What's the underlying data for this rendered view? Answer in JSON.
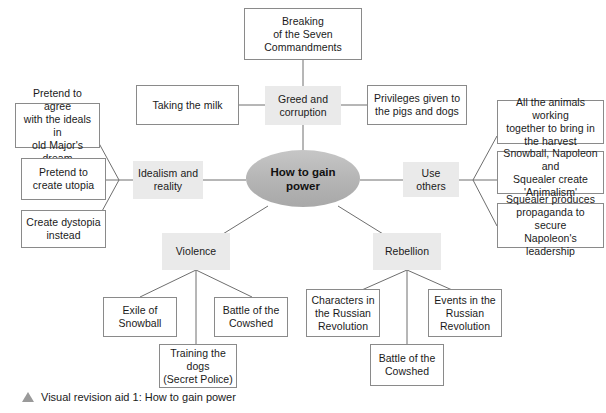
{
  "diagram": {
    "type": "mind-map",
    "center": {
      "label": "How to gain\npower",
      "shape": "ellipse",
      "fill": "#b9b9b9"
    },
    "hub_fill": "#eaeaea",
    "leaf_fill": "#ffffff",
    "leaf_border": "#8a8a8a",
    "edge_color": "#6e6e6e",
    "branches": [
      {
        "id": "greed",
        "label": "Greed and\ncorruption",
        "children": [
          {
            "id": "commandments",
            "label": "Breaking\nof the Seven\nCommandments"
          },
          {
            "id": "milk",
            "label": "Taking the milk"
          },
          {
            "id": "privileges",
            "label": "Privileges given to\nthe pigs and dogs"
          }
        ]
      },
      {
        "id": "idealism",
        "label": "Idealism and\nreality",
        "children": [
          {
            "id": "pretend-agree",
            "label": "Pretend to agree\nwith the ideals in\nold Major's dream"
          },
          {
            "id": "pretend-utopia",
            "label": "Pretend to\ncreate utopia"
          },
          {
            "id": "dystopia",
            "label": "Create dystopia\ninstead"
          }
        ]
      },
      {
        "id": "use-others",
        "label": "Use others",
        "children": [
          {
            "id": "harvest",
            "label": "All the animals working\ntogether to bring in\nthe harvest"
          },
          {
            "id": "animalism",
            "label": "Snowball, Napoleon and\nSquealer create\n'Animalism'"
          },
          {
            "id": "propaganda",
            "label": "Squealer produces\npropaganda to secure\nNapoleon's leadership"
          }
        ]
      },
      {
        "id": "violence",
        "label": "Violence",
        "children": [
          {
            "id": "exile",
            "label": "Exile of\nSnowball"
          },
          {
            "id": "training-dogs",
            "label": "Training the\ndogs\n(Secret Police)"
          },
          {
            "id": "cowshed-violence",
            "label": "Battle of the\nCowshed"
          }
        ]
      },
      {
        "id": "rebellion",
        "label": "Rebellion",
        "children": [
          {
            "id": "characters-russian",
            "label": "Characters in\nthe Russian\nRevolution"
          },
          {
            "id": "cowshed-rebellion",
            "label": "Battle of the\nCowshed"
          },
          {
            "id": "events-russian",
            "label": "Events in the\nRussian\nRevolution"
          }
        ]
      }
    ]
  },
  "caption": {
    "marker": "triangle-up-icon",
    "text": "Visual revision aid 1: How to gain power"
  }
}
